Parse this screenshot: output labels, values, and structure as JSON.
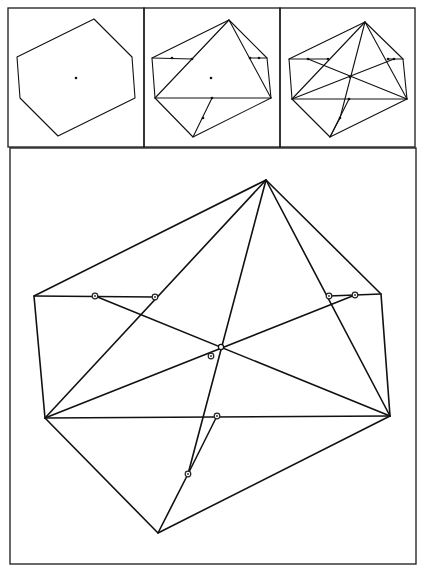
{
  "figure": {
    "colors": {
      "stroke": "#111111",
      "background": "#ffffff"
    },
    "panels": [
      {
        "id": "panel-1",
        "frame": [
          8,
          8,
          144,
          147
        ],
        "hexagon": [
          [
            94,
            19
          ],
          [
            132,
            57
          ],
          [
            135,
            98
          ],
          [
            58,
            136
          ],
          [
            20,
            98
          ],
          [
            17,
            57
          ]
        ],
        "lines": [],
        "dots": [
          [
            76,
            78
          ]
        ],
        "rings": []
      },
      {
        "id": "panel-2",
        "frame": [
          144,
          8,
          280,
          147
        ],
        "hexagon": [
          [
            229,
            20
          ],
          [
            267,
            58
          ],
          [
            271,
            98
          ],
          [
            193,
            137
          ],
          [
            155,
            98
          ],
          [
            152,
            58
          ]
        ],
        "lines": [
          [
            [
              152,
              58
            ],
            [
              192,
              59
            ]
          ],
          [
            [
              250,
              58
            ],
            [
              267,
              58
            ]
          ],
          [
            [
              155,
              98
            ],
            [
              229,
              20
            ]
          ],
          [
            [
              229,
              20
            ],
            [
              271,
              98
            ]
          ],
          [
            [
              155,
              98
            ],
            [
              271,
              98
            ]
          ],
          [
            [
              212,
              98
            ],
            [
              193,
              137
            ]
          ]
        ],
        "dots": [
          [
            211,
            78
          ],
          [
            172,
            58
          ],
          [
            192,
            59
          ],
          [
            250,
            58
          ],
          [
            259,
            58
          ],
          [
            212,
            98
          ],
          [
            203,
            118
          ]
        ],
        "rings": []
      },
      {
        "id": "panel-3",
        "frame": [
          280,
          8,
          415,
          147
        ],
        "hexagon": [
          [
            365,
            22
          ],
          [
            403,
            59
          ],
          [
            407,
            99
          ],
          [
            330,
            137
          ],
          [
            292,
            99
          ],
          [
            289,
            59
          ]
        ],
        "lines": [
          [
            [
              289,
              59
            ],
            [
              328,
              59
            ]
          ],
          [
            [
              388,
              59
            ],
            [
              403,
              59
            ]
          ],
          [
            [
              292,
              99
            ],
            [
              365,
              22
            ]
          ],
          [
            [
              365,
              22
            ],
            [
              407,
              99
            ]
          ],
          [
            [
              292,
              99
            ],
            [
              407,
              99
            ]
          ],
          [
            [
              349,
              99
            ],
            [
              330,
              137
            ]
          ],
          [
            [
              308,
              59
            ],
            [
              407,
              99
            ]
          ],
          [
            [
              292,
              99
            ],
            [
              394,
              59
            ]
          ],
          [
            [
              365,
              22
            ],
            [
              340,
              118
            ]
          ],
          [
            [
              340,
              118
            ],
            [
              330,
              137
            ]
          ]
        ],
        "dots": [
          [
            350,
            77
          ],
          [
            308,
            59
          ],
          [
            328,
            59
          ],
          [
            388,
            59
          ],
          [
            394,
            59
          ],
          [
            349,
            99
          ],
          [
            340,
            118
          ]
        ],
        "rings": []
      },
      {
        "id": "panel-main",
        "frame": [
          10,
          148,
          416,
          564
        ],
        "hexagon": [
          [
            266,
            180
          ],
          [
            381,
            294
          ],
          [
            390,
            416
          ],
          [
            158,
            533
          ],
          [
            45,
            418
          ],
          [
            34,
            296
          ]
        ],
        "lines": [
          [
            [
              34,
              296
            ],
            [
              155,
              297
            ]
          ],
          [
            [
              329,
              296
            ],
            [
              381,
              294
            ]
          ],
          [
            [
              45,
              418
            ],
            [
              266,
              180
            ]
          ],
          [
            [
              266,
              180
            ],
            [
              390,
              416
            ]
          ],
          [
            [
              45,
              418
            ],
            [
              390,
              416
            ]
          ],
          [
            [
              95,
              296
            ],
            [
              390,
              416
            ]
          ],
          [
            [
              45,
              418
            ],
            [
              355,
              295
            ]
          ],
          [
            [
              266,
              180
            ],
            [
              188,
              474
            ]
          ],
          [
            [
              188,
              474
            ],
            [
              158,
              533
            ]
          ],
          [
            [
              217,
              416
            ],
            [
              188,
              474
            ]
          ]
        ],
        "dots": [],
        "rings": [
          [
            95,
            296
          ],
          [
            155,
            297
          ],
          [
            329,
            296
          ],
          [
            355,
            295
          ],
          [
            211,
            356
          ],
          [
            217,
            416
          ],
          [
            188,
            474
          ]
        ],
        "hollow_points": [
          [
            221,
            347
          ]
        ]
      }
    ]
  }
}
